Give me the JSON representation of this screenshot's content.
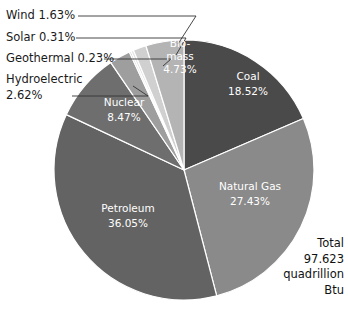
{
  "chart_data": {
    "type": "pie",
    "title": "",
    "total_label": "Total",
    "total_value": "97.623",
    "total_unit_line1": "quadrillion",
    "total_unit_line2": "Btu",
    "unit": "quadrillion Btu",
    "categories": [
      "Coal",
      "Natural Gas",
      "Petroleum",
      "Nuclear",
      "Hydroelectric",
      "Geothermal",
      "Solar",
      "Wind",
      "Biomass"
    ],
    "values": [
      18.52,
      27.43,
      36.05,
      8.47,
      2.62,
      0.23,
      0.31,
      1.63,
      4.73
    ],
    "start_angle_deg": 0,
    "direction": "clockwise",
    "legend": "none",
    "slices": [
      {
        "name": "Coal",
        "label": "Coal",
        "percent": "18.52%",
        "value": 18.52,
        "color": "#4a4a4a",
        "label_placement": "inside"
      },
      {
        "name": "Natural Gas",
        "label": "Natural Gas",
        "percent": "27.43%",
        "value": 27.43,
        "color": "#8a8a8a",
        "label_placement": "inside"
      },
      {
        "name": "Petroleum",
        "label": "Petroleum",
        "percent": "36.05%",
        "value": 36.05,
        "color": "#636363",
        "label_placement": "inside"
      },
      {
        "name": "Nuclear",
        "label": "Nuclear",
        "percent": "8.47%",
        "value": 8.47,
        "color": "#6e6e6e",
        "label_placement": "inside"
      },
      {
        "name": "Hydroelectric",
        "label": "Hydroelectric",
        "percent": "2.62%",
        "value": 2.62,
        "color": "#9e9e9e",
        "label_placement": "outside-left"
      },
      {
        "name": "Geothermal",
        "label": "Geothermal",
        "percent": "0.23%",
        "value": 0.23,
        "color": "#cccccc",
        "label_placement": "outside-left"
      },
      {
        "name": "Solar",
        "label": "Solar",
        "percent": "0.31%",
        "value": 0.31,
        "color": "#e2e2e2",
        "label_placement": "outside-left"
      },
      {
        "name": "Wind",
        "label": "Wind",
        "percent": "1.63%",
        "value": 1.63,
        "color": "#d0d0d0",
        "label_placement": "outside-left"
      },
      {
        "name": "Biomass",
        "label": "Bio-mass",
        "percent": "4.73%",
        "value": 4.73,
        "color": "#b4b4b4",
        "label_placement": "inside"
      }
    ]
  },
  "outside_labels": {
    "wind": "Wind 1.63%",
    "solar": "Solar 0.31%",
    "geothermal": "Geothermal 0.23%",
    "hydro_line1": "Hydroelectric",
    "hydro_line2": "2.62%"
  },
  "inside_labels": {
    "coal_name": "Coal",
    "coal_pct": "18.52%",
    "gas_name": "Natural Gas",
    "gas_pct": "27.43%",
    "petroleum_name": "Petroleum",
    "petroleum_pct": "36.05%",
    "nuclear_name": "Nuclear",
    "nuclear_pct": "8.47%",
    "biomass_l1": "Bio-",
    "biomass_l2": "mass",
    "biomass_pct": "4.73%"
  },
  "total_block": {
    "l1": "Total",
    "l2": "97.623",
    "l3": "quadrillion",
    "l4": "Btu"
  },
  "colors": {
    "background": "#ffffff",
    "text": "#1a1a1a",
    "slice_text": "#ffffff",
    "leader_line": "#333333"
  }
}
